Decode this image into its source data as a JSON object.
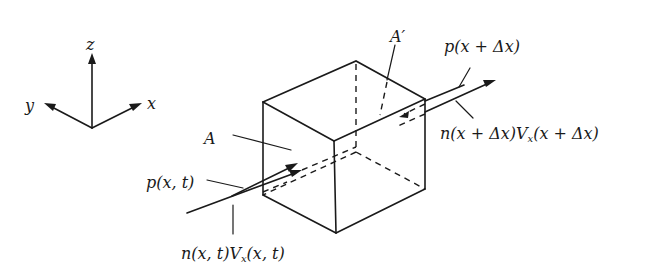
{
  "diagram": {
    "axes": {
      "z_label": "z",
      "y_label": "y",
      "x_label": "x"
    },
    "labels": {
      "face_left": "A",
      "face_right": "A′",
      "pressure_in": "p(x, t)",
      "pressure_out": "p(x + Δx)",
      "flux_in_prefix": "n(x, t)V",
      "flux_in_sub": "x",
      "flux_in_suffix": "(x, t)",
      "flux_out_prefix": "n(x + Δx)V",
      "flux_out_sub": "x",
      "flux_out_suffix": "(x + Δx)"
    },
    "colors": {
      "ink": "#1a1a1a",
      "background": "#ffffff"
    }
  }
}
